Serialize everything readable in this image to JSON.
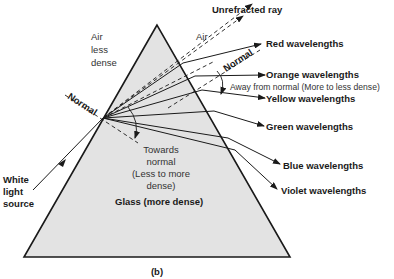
{
  "figure": {
    "caption": "(b)",
    "colors": {
      "prism_fill": "#e3e3e3",
      "line": "#1a1a1a",
      "background": "#ffffff"
    }
  },
  "labels": {
    "air_top_left": [
      "Air",
      "less",
      "dense"
    ],
    "air_right": "Air",
    "unrefracted_ray": "Unrefracted ray",
    "normal_entry": "Normal",
    "normal_exit": "Normal",
    "away_from_normal": "Away from normal  (More to less dense)",
    "towards_normal": [
      "Towards",
      "normal",
      "(Less to more",
      "dense)"
    ],
    "glass": "Glass (more dense)",
    "white_light_source": [
      "White",
      "light",
      "source"
    ]
  },
  "wavelengths": [
    {
      "label": "Red wavelengths"
    },
    {
      "label": "Orange wavelengths"
    },
    {
      "label": "Yellow wavelengths"
    },
    {
      "label": "Green wavelengths"
    },
    {
      "label": "Blue wavelengths"
    },
    {
      "label": "Violet wavelengths"
    }
  ]
}
